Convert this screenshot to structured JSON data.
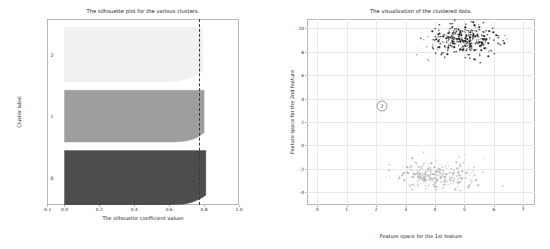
{
  "figure": {
    "width": 550,
    "height": 249,
    "background": "#ffffff"
  },
  "chart_data": [
    {
      "type": "area",
      "name": "silhouette-plot",
      "title": "The silhouette plot for the various clusters.",
      "xlabel": "The silhouette coefficient values",
      "ylabel": "Cluster label",
      "xlim": [
        -0.1,
        1.0
      ],
      "ylim": [
        0,
        1000
      ],
      "grid": false,
      "xticks": [
        "-0.1",
        "0.0",
        "0.2",
        "0.4",
        "0.6",
        "0.8",
        "1.0"
      ],
      "xtick_values": [
        -0.1,
        0.0,
        0.2,
        0.4,
        0.6,
        0.8,
        1.0
      ],
      "cluster_tick_labels": [
        "0",
        "1",
        "2"
      ],
      "threshold": {
        "label": "average silhouette score",
        "value": 0.77,
        "color": "#3a3a3a",
        "style": "dashed"
      },
      "clusters": [
        {
          "label": "0",
          "color": "#4d4d4d",
          "size": 400,
          "max_silhouette": 0.81,
          "min_silhouette": 0.6
        },
        {
          "label": "1",
          "color": "#9e9e9e",
          "size": 380,
          "max_silhouette": 0.8,
          "min_silhouette": 0.62
        },
        {
          "label": "2",
          "color": "#f1f1f1",
          "size": 400,
          "max_silhouette": 0.79,
          "min_silhouette": 0.55
        }
      ]
    },
    {
      "type": "scatter",
      "name": "cluster-visualization",
      "title": "The visualization of the clustered data.",
      "xlabel": "Feature space for the 1st feature",
      "ylabel": "Feature space for the 2nd feature",
      "xlim": [
        -0.35,
        7.4
      ],
      "ylim": [
        -5.1,
        10.8
      ],
      "grid": true,
      "xticks": [
        "0",
        "1",
        "2",
        "3",
        "4",
        "5",
        "6",
        "7"
      ],
      "xtick_values": [
        0,
        1,
        2,
        3,
        4,
        5,
        6,
        7
      ],
      "yticks": [
        "10",
        "8",
        "6",
        "4",
        "2",
        "0",
        "-2",
        "-4"
      ],
      "ytick_values": [
        10,
        8,
        6,
        4,
        2,
        0,
        -2,
        -4
      ],
      "series": [
        {
          "name": "cluster-upper",
          "color": "#2b2b2b",
          "marker": "dot",
          "n_points": 330,
          "center": [
            5.0,
            9.0
          ],
          "spread": [
            0.62,
            0.62
          ]
        },
        {
          "name": "cluster-lower",
          "color": "#b5b5b5",
          "marker": "dot",
          "n_points": 300,
          "center": [
            4.1,
            -2.6
          ],
          "spread": [
            0.6,
            0.6
          ]
        }
      ],
      "centroid_markers": [
        {
          "label": "2",
          "x": 2.2,
          "y": 3.35
        }
      ]
    }
  ]
}
